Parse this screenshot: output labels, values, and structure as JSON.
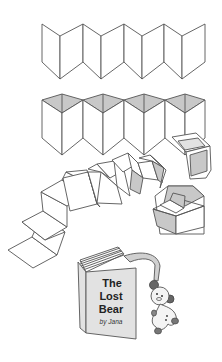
{
  "illustration": {
    "description": "Accordion-fold book construction steps",
    "steps": [
      {
        "id": "step-1",
        "name": "flat-accordion-fold"
      },
      {
        "id": "step-2",
        "name": "accordion-with-top-triangles"
      },
      {
        "id": "step-3",
        "name": "extended-accordion-into-box"
      },
      {
        "id": "step-4",
        "name": "finished-book-with-bear"
      }
    ],
    "book": {
      "title_line1": "The",
      "title_line2": "Lost",
      "title_line3": "Bear",
      "byline": "by Jana"
    },
    "colors": {
      "line": "#555555",
      "shade": "#c8c8c8",
      "light_shade": "#e2e2e2",
      "background": "#ffffff"
    }
  }
}
